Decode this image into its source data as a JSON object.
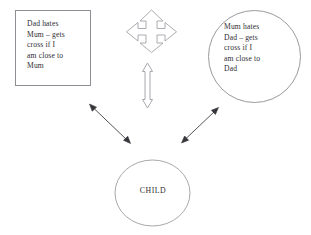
{
  "diagram": {
    "background_color": "#ffffff",
    "stroke_color": "#8a8a90",
    "arrow_fill": "#ffffff",
    "thin_arrow_color": "#3a3a40",
    "text_color": "#2e2e33",
    "nodes": [
      {
        "id": "dad",
        "shape": "rectangle",
        "label": "Dad  hates\nMum – gets\ncross if I\nam close to\nMum",
        "lines": [
          "Dad  hates",
          "Mum – gets",
          "cross if I",
          "am close to",
          "Mum"
        ]
      },
      {
        "id": "mum",
        "shape": "ellipse",
        "label": "Mum hates\nDad – gets\ncross if I\nam close to\nDad",
        "lines": [
          "Mum hates",
          "Dad – gets",
          "cross if I",
          "am close to",
          "Dad"
        ]
      },
      {
        "id": "child",
        "shape": "ellipse",
        "label": "CHILD",
        "lines": [
          "CHILD"
        ]
      }
    ],
    "connectors": [
      {
        "id": "quad-arrow",
        "icon": "four-way-arrow-icon",
        "style": "outlined block arrow",
        "heads": "four",
        "between": "dad and mum (top, conflict)"
      },
      {
        "id": "vertical-arrow",
        "icon": "up-down-arrow-icon",
        "style": "outlined block arrow",
        "heads": "two",
        "between": "parents and child (centre)"
      },
      {
        "id": "dad-child-arrow",
        "icon": "double-headed-line-arrow-icon",
        "style": "thin line arrow",
        "heads": "two",
        "between": "dad and child"
      },
      {
        "id": "mum-child-arrow",
        "icon": "double-headed-line-arrow-icon",
        "style": "thin line arrow",
        "heads": "two",
        "between": "mum and child"
      }
    ]
  }
}
